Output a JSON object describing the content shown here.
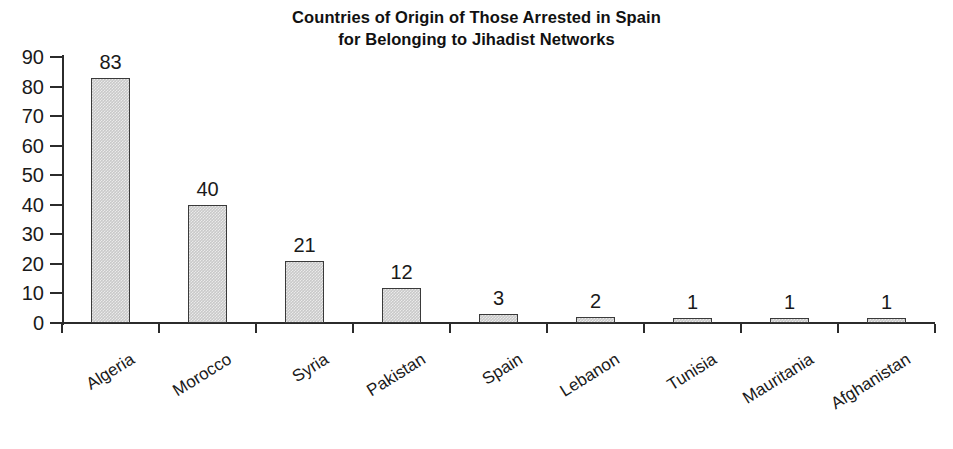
{
  "chart_data": {
    "type": "bar",
    "title": "Countries of Origin of Those Arrested in Spain for Belonging to Jihadist Networks",
    "title_lines": [
      "Countries of Origin of Those Arrested in Spain",
      "for Belonging to Jihadist Networks"
    ],
    "xlabel": "",
    "ylabel": "",
    "ylim": [
      0,
      90
    ],
    "yticks": [
      0,
      10,
      20,
      30,
      40,
      50,
      60,
      70,
      80,
      90
    ],
    "ytick_labels": [
      "0",
      "10",
      "20",
      "30",
      "40",
      "50",
      "60",
      "70",
      "80",
      "90"
    ],
    "grid": false,
    "legend": "none",
    "categories": [
      "Algeria",
      "Morocco",
      "Syria",
      "Pakistan",
      "Spain",
      "Lebanon",
      "Tunisia",
      "Mauritania",
      "Afghanistan"
    ],
    "values": [
      83,
      40,
      21,
      12,
      3,
      2,
      1,
      1,
      1
    ],
    "value_labels": [
      "83",
      "40",
      "21",
      "12",
      "3",
      "2",
      "1",
      "1",
      "1"
    ],
    "bar_color": "#c9c9c9",
    "bar_edge_color": "#3a3a3a",
    "axis_color": "#2b2b2b",
    "background_color": "#ffffff",
    "text_color": "#1a1a1a"
  }
}
